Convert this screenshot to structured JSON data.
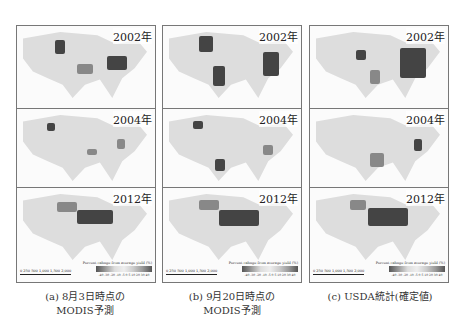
{
  "figure": {
    "columns": [
      {
        "id": "a",
        "caption_line1": "(a) 8月3日時点の",
        "caption_line2": "MODIS予測",
        "maps": [
          {
            "year": "2002年"
          },
          {
            "year": "2004年"
          },
          {
            "year": "2012年"
          }
        ]
      },
      {
        "id": "b",
        "caption_line1": "(b) 9月20日時点の",
        "caption_line2": "MODIS予測",
        "maps": [
          {
            "year": "2002年"
          },
          {
            "year": "2004年"
          },
          {
            "year": "2012年"
          }
        ]
      },
      {
        "id": "c",
        "caption_line1": "(c) USDA統計(確定値)",
        "caption_line2": "",
        "maps": [
          {
            "year": "2002年"
          },
          {
            "year": "2004年"
          },
          {
            "year": "2012年"
          }
        ]
      }
    ],
    "legend": {
      "title": "Percent cahnge from average yield (%)",
      "scale_bar": "0 250 500   1,000   1,500   2,000",
      "ticks": "-40 -30 -20 -10 -5 0 5 10 20 30 40"
    }
  }
}
